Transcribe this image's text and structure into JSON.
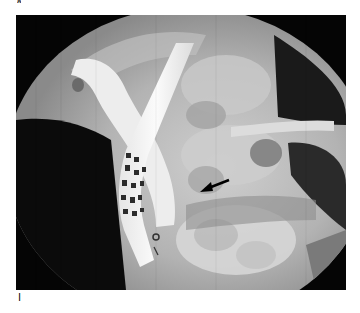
{
  "figure": {
    "type": "fluoroscopic radiograph",
    "top_label_partial": "a",
    "panel_label": "I",
    "annotations": [
      {
        "kind": "arrow",
        "direction": "pointing-left-down",
        "color": "#000000"
      }
    ],
    "colors": {
      "background": "#ffffff",
      "frame": "#050505",
      "field": "#bdbdbd",
      "bright": "#f2f2f2",
      "bone": "#9a9a9a"
    }
  }
}
